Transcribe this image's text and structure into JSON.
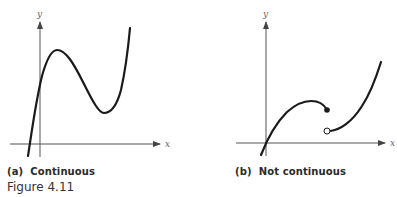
{
  "figure": {
    "label": "Figure 4.11",
    "panels": [
      {
        "id": "a",
        "caption": "(a)  Continuous",
        "x_axis_label": "x",
        "y_axis_label": "y",
        "description": "Cubic-like curve: rises steeply through y-axis, local maximum, local minimum, then rises again"
      },
      {
        "id": "b",
        "caption": "(b)  Not continuous",
        "x_axis_label": "x",
        "y_axis_label": "y",
        "description": "Curve through origin rising to a hump ending at a filled dot; jump discontinuity with open circle below, then curve rising to the right"
      }
    ]
  },
  "colors": {
    "curve": "#1a1a1a",
    "axis": "#555555",
    "text": "#2a2a2a"
  }
}
